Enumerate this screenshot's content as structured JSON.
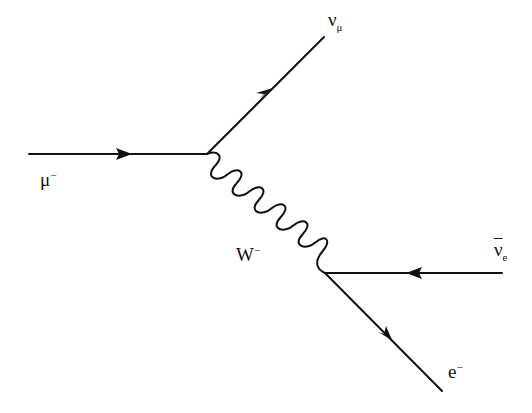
{
  "diagram": {
    "colors": {
      "line": "#111111",
      "background": "#ffffff"
    },
    "vertices": [
      {
        "id": "v1",
        "x": 207,
        "y": 154
      },
      {
        "id": "v2",
        "x": 325,
        "y": 273
      }
    ],
    "particles": [
      {
        "id": "muon",
        "base": "μ",
        "sup": "−",
        "sub": "",
        "bar": false,
        "type": "fermion",
        "from": [
          29,
          154
        ],
        "to": [
          207,
          154
        ]
      },
      {
        "id": "muon-neutrino",
        "base": "ν",
        "sup": "",
        "sub": "μ",
        "bar": false,
        "type": "fermion",
        "from": [
          207,
          154
        ],
        "to": [
          324,
          37
        ]
      },
      {
        "id": "w-boson",
        "base": "W",
        "sup": "−",
        "sub": "",
        "bar": false,
        "type": "boson",
        "from": [
          207,
          154
        ],
        "to": [
          325,
          273
        ]
      },
      {
        "id": "electron-antineutrino",
        "base": "ν",
        "sup": "",
        "sub": "e",
        "bar": true,
        "type": "fermion",
        "from": [
          502,
          273
        ],
        "to": [
          325,
          273
        ]
      },
      {
        "id": "electron",
        "base": "e",
        "sup": "−",
        "sub": "",
        "bar": false,
        "type": "fermion",
        "from": [
          325,
          273
        ],
        "to": [
          442,
          391
        ]
      }
    ]
  }
}
